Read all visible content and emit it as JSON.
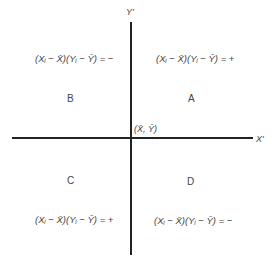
{
  "axes": {
    "y_label": "Y'",
    "x_label": "X'",
    "origin_label": "(X̄, Ȳ)"
  },
  "quadrants": [
    {
      "id": "A",
      "label": "A",
      "expression": "(Xᵢ − X̄)(Yᵢ − Ȳ) = +"
    },
    {
      "id": "B",
      "label": "B",
      "expression": "(Xᵢ − X̄)(Yᵢ − Ȳ) = −"
    },
    {
      "id": "C",
      "label": "C",
      "expression": "(Xᵢ − X̄)(Yᵢ − Ȳ) = +"
    },
    {
      "id": "D",
      "label": "D",
      "expression": "(Xᵢ − X̄)(Yᵢ − Ȳ) = −"
    }
  ]
}
